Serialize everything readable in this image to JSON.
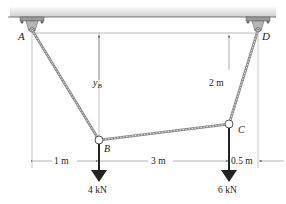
{
  "diagram": {
    "type": "cable-structure-statics",
    "points": {
      "A": {
        "label": "A"
      },
      "B": {
        "label": "B"
      },
      "C": {
        "label": "C"
      },
      "D": {
        "label": "D"
      }
    },
    "dimensions": {
      "y_B": {
        "main": "y",
        "sub": "B"
      },
      "vertical_CD": "2 m",
      "horizontal_AB": "1 m",
      "horizontal_BC": "3 m",
      "horizontal_CD": "0.5 m"
    },
    "loads": {
      "B": "4 kN",
      "C": "6 kN"
    },
    "colors": {
      "cable": "#8a8a8a",
      "ceiling": "#d9d9d9",
      "line": "#555555",
      "load_arrow": "#222222"
    }
  }
}
